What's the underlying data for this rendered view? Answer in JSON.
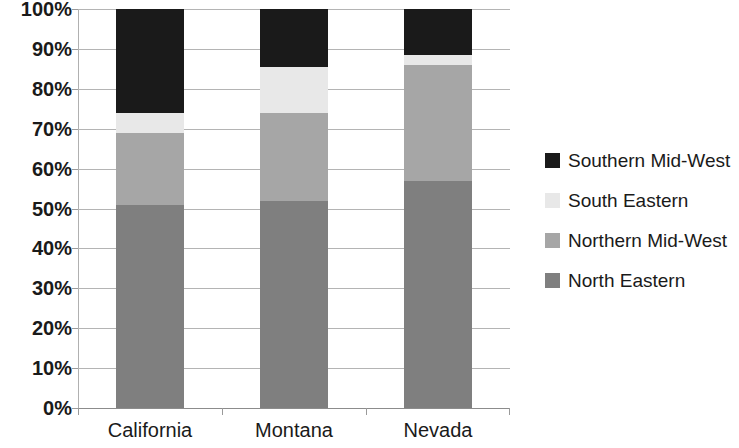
{
  "chart_data": {
    "type": "bar",
    "subtype": "stacked-100-percent",
    "title": "",
    "subtitle": "",
    "xlabel": "",
    "ylabel": "",
    "categories": [
      "California",
      "Montana",
      "Nevada"
    ],
    "series": [
      {
        "name": "North Eastern",
        "color": "#7f7f7f",
        "values": [
          51,
          52,
          57
        ]
      },
      {
        "name": "Northern Mid-West",
        "color": "#a6a6a6",
        "values": [
          18,
          22,
          29
        ]
      },
      {
        "name": "South Eastern",
        "color": "#e8e8e8",
        "values": [
          5,
          11.5,
          2.5
        ]
      },
      {
        "name": "Southern Mid-West",
        "color": "#1a1a1a",
        "values": [
          26,
          14.5,
          11.5
        ]
      }
    ],
    "ylim": [
      0,
      100
    ],
    "y_tick_values": [
      0,
      10,
      20,
      30,
      40,
      50,
      60,
      70,
      80,
      90,
      100
    ],
    "y_tick_labels": [
      "0%",
      "10%",
      "20%",
      "30%",
      "40%",
      "50%",
      "60%",
      "70%",
      "80%",
      "90%",
      "100%"
    ],
    "grid": true,
    "grid_axis": "y",
    "legend_position": "right",
    "legend_order": [
      "Southern Mid-West",
      "South Eastern",
      "Northern Mid-West",
      "North Eastern"
    ]
  },
  "legend": {
    "items": [
      {
        "label": "Southern Mid-West",
        "color": "#1a1a1a"
      },
      {
        "label": "South Eastern",
        "color": "#e8e8e8"
      },
      {
        "label": "Northern Mid-West",
        "color": "#a6a6a6"
      },
      {
        "label": "North Eastern",
        "color": "#7f7f7f"
      }
    ]
  },
  "colors": {
    "gridline": "#b4b4b4",
    "axis": "#9a9a9a",
    "text": "#1a1a1a",
    "background": "#ffffff"
  }
}
